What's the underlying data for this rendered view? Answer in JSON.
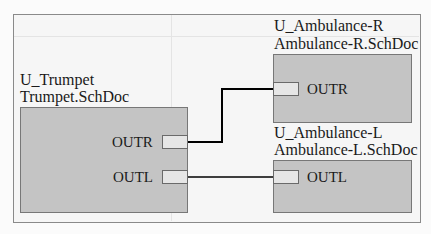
{
  "sheets": [
    {
      "designator": "U_Trumpet",
      "filename": "Trumpet.SchDoc",
      "ports": [
        {
          "name": "OUTR"
        },
        {
          "name": "OUTL"
        }
      ]
    },
    {
      "designator": "U_Ambulance-R",
      "filename": "Ambulance-R.SchDoc",
      "ports": [
        {
          "name": "OUTR"
        }
      ]
    },
    {
      "designator": "U_Ambulance-L",
      "filename": "Ambulance-L.SchDoc",
      "ports": [
        {
          "name": "OUTL"
        }
      ]
    }
  ],
  "colors": {
    "block_fill": "#c4c4c4",
    "port_fill": "#e6e6e6",
    "wire": "#000000"
  }
}
